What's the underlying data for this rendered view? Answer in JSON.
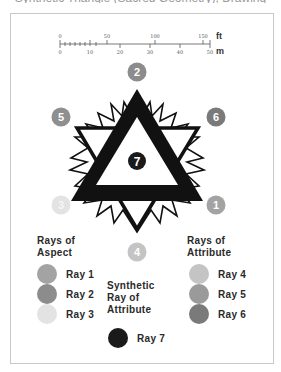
{
  "top_caption": "Synthetic Triangle (Sacred Geometry), Drawing",
  "scale_bar": {
    "ft_unit": "ft",
    "m_unit": "m",
    "ft_ticks": [
      "0",
      "50",
      "100",
      "150"
    ],
    "m_ticks": [
      "0",
      "10",
      "20",
      "30",
      "40",
      "50",
      "60"
    ]
  },
  "diagram": {
    "center_label": "7",
    "ray_markers": [
      {
        "label": "2",
        "color": "#8c8c8c",
        "text_color": "#ffffff"
      },
      {
        "label": "5",
        "color": "#8f8f8f",
        "text_color": "#ffffff"
      },
      {
        "label": "6",
        "color": "#7a7a7a",
        "text_color": "#ffffff"
      },
      {
        "label": "3",
        "color": "#e3e3e3",
        "text_color": "#f6f6f6"
      },
      {
        "label": "1",
        "color": "#a3a3a3",
        "text_color": "#ffffff"
      },
      {
        "label": "4",
        "color": "#c4c4c4",
        "text_color": "#ffffff"
      }
    ]
  },
  "legend": {
    "aspect_title_line1": "Rays of",
    "aspect_title_line2": "Aspect",
    "attribute_title_line1": "Rays of",
    "attribute_title_line2": "Attribute",
    "synthetic_title_line1": "Synthetic",
    "synthetic_title_line2": "Ray of",
    "synthetic_title_line3": "Attribute",
    "aspect_items": [
      {
        "label": "Ray 1",
        "color": "#a3a3a3"
      },
      {
        "label": "Ray 2",
        "color": "#8c8c8c"
      },
      {
        "label": "Ray 3",
        "color": "#e3e3e3"
      }
    ],
    "attribute_items": [
      {
        "label": "Ray 4",
        "color": "#c4c4c4"
      },
      {
        "label": "Ray 5",
        "color": "#9a9a9a"
      },
      {
        "label": "Ray 6",
        "color": "#7a7a7a"
      }
    ],
    "synthetic_items": [
      {
        "label": "Ray 7",
        "color": "#1a1a1a"
      }
    ]
  }
}
